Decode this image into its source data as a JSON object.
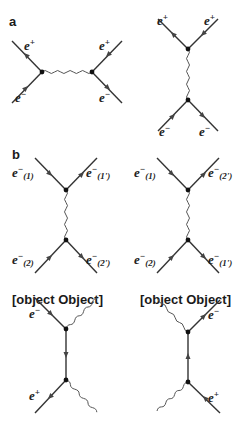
{
  "figure": {
    "panels": [
      {
        "id": "a",
        "label": "a",
        "description": "e+ e- annihilation (s-channel) and exchange (t-channel) Bhabha scattering",
        "sub_diagrams": [
          {
            "name": "s-channel",
            "particles": [
              "e+",
              "e-",
              "e+",
              "e-"
            ]
          },
          {
            "name": "t-channel",
            "particles": [
              "e+",
              "e+",
              "e-",
              "e-"
            ]
          }
        ]
      },
      {
        "id": "b",
        "label": "b",
        "description": "Møller scattering direct and exchange diagrams",
        "sub_diagrams": [
          {
            "name": "direct",
            "particles": [
              "e−(1)",
              "e−(1')",
              "e−(2)",
              "e−(2')"
            ]
          },
          {
            "name": "exchange",
            "particles": [
              "e−(1)",
              "e−(2')",
              "e−(2)",
              "e−(1')"
            ]
          }
        ]
      },
      {
        "id": "c",
        "label": "c",
        "description": "pair annihilation into two photons",
        "particles": [
          "e−",
          "e+"
        ]
      },
      {
        "id": "d",
        "label": "d",
        "description": "pair annihilation into two photons (crossed)",
        "particles": [
          "e−",
          "e+"
        ]
      }
    ]
  },
  "labels": {
    "a": "a",
    "b": "b",
    "c": {
      "top": "e",
      "top_sup": "−",
      "bottom": "e",
      "bottom_sup": "+"
    },
    "d": {
      "top": "e",
      "top_sup": "−",
      "bottom": "e",
      "bottom_sup": "+"
    },
    "a1": {
      "tl": "e",
      "tl_sup": "+",
      "bl": "e",
      "bl_sup": "−",
      "tr": "e",
      "tr_sup": "+",
      "br": "e",
      "br_sup": "−"
    },
    "a2": {
      "tl": "e",
      "tl_sup": "+",
      "tr": "e",
      "tr_sup": "+",
      "bl": "e",
      "bl_sup": "−",
      "br": "e",
      "br_sup": "−"
    },
    "b1": {
      "tl": "e",
      "tl_sup": "−",
      "tl_sub": "(1)",
      "tr": "e",
      "tr_sup": "−",
      "tr_sub": "(1')",
      "bl": "e",
      "bl_sup": "−",
      "bl_sub": "(2)",
      "br": "e",
      "br_sup": "−",
      "br_sub": "(2')"
    },
    "b2": {
      "tl": "e",
      "tl_sup": "−",
      "tl_sub": "(1)",
      "tr": "e",
      "tr_sup": "−",
      "tr_sub": "(2')",
      "bl": "e",
      "bl_sup": "−",
      "bl_sub": "(2)",
      "br": "e",
      "br_sup": "−",
      "br_sub": "(1')"
    }
  },
  "colors": {
    "line": "#333333",
    "photon": "#555555",
    "vertex": "#111111",
    "background": "#ffffff"
  }
}
